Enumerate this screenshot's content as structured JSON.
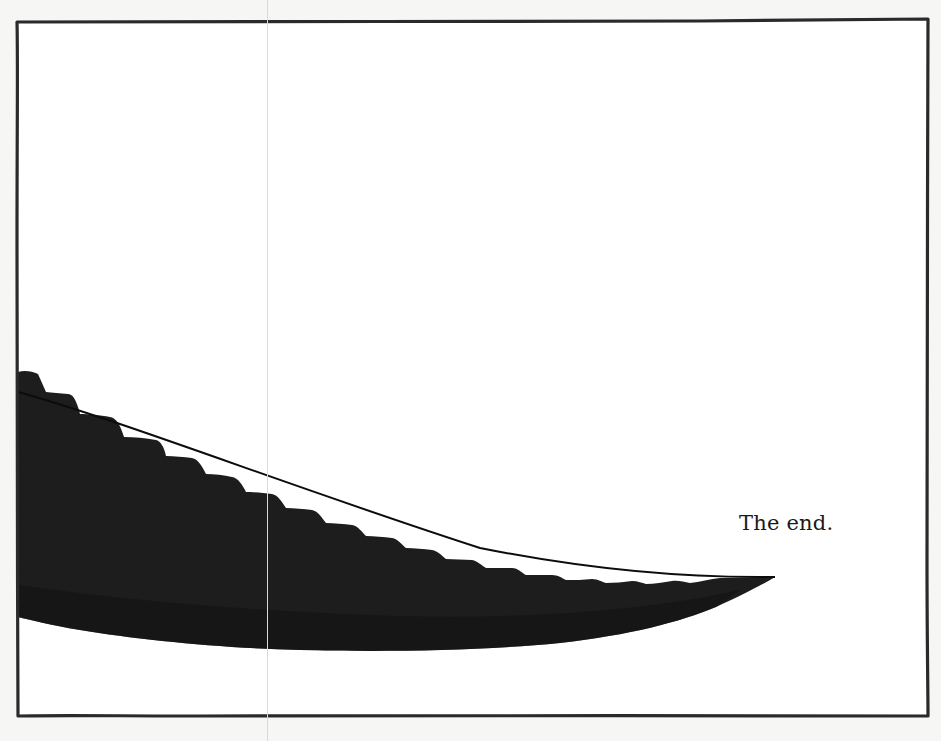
{
  "page": {
    "type": "storybook-page",
    "caption": "The end."
  },
  "illustration": {
    "subject": "dark serrated blade-like shape entering from the left edge and tapering to a point",
    "fill_color": "#1c1c1c",
    "frame_color": "#2a2a2a",
    "background_color": "#ffffff"
  }
}
